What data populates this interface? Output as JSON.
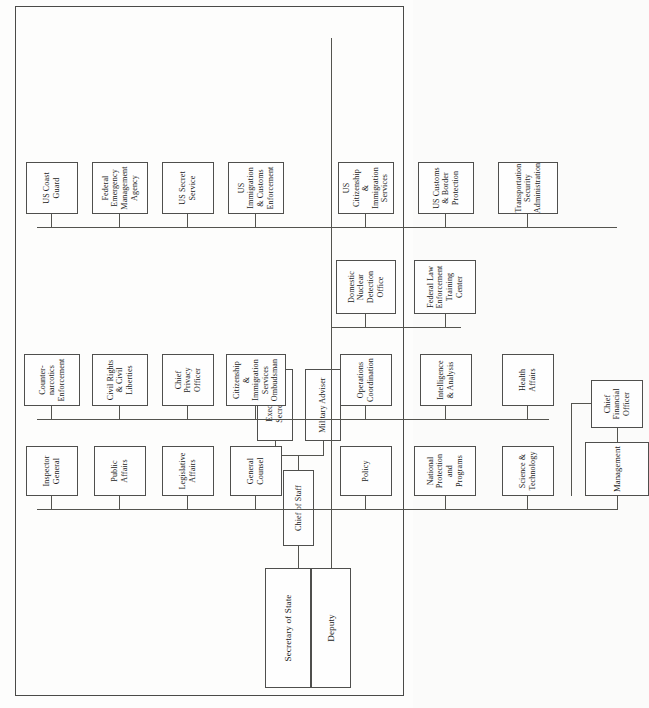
{
  "chart": {
    "type": "org-chart",
    "orientation": "rotated-90-ccw",
    "root": {
      "label": "Secretary of State",
      "deputy_label": "Deputy"
    },
    "staff": {
      "chief_of_staff": "Chief of Staff",
      "executive_secretariat": "Executive Secretariat",
      "military_adviser": "Military Adviser"
    },
    "column_a": [
      {
        "label": "Inspector General"
      },
      {
        "label": "Public Affairs"
      },
      {
        "label": "Legislative Affairs"
      },
      {
        "label": "General Counsel"
      },
      {
        "label": "Policy"
      },
      {
        "label": "National Protection and Programs"
      },
      {
        "label": "Science & Technology"
      },
      {
        "label": "Management",
        "attached": "Chief Financial Officer"
      }
    ],
    "column_b": [
      {
        "label": "Counter-narcotics Enforcement"
      },
      {
        "label": "Civil Rights & Civil Liberties"
      },
      {
        "label": "Chief Privacy Officer"
      },
      {
        "label": "Citizenship & Immigration Services Ombudsman"
      },
      {
        "label": "Operations Coordination"
      },
      {
        "label": "Intelligence & Analysis"
      },
      {
        "label": "Health Affairs"
      }
    ],
    "column_c": [
      {
        "label": "Domestic Nuclear Detection Office"
      },
      {
        "label": "Federal Law Enforcement Training Center"
      }
    ],
    "column_d": [
      {
        "label": "US Coast Guard"
      },
      {
        "label": "Federal Emergency Management Agency"
      },
      {
        "label": "US Secret Service"
      },
      {
        "label": "US Immigration & Customs Enforcement"
      },
      {
        "label": "US Citizenship & Immigration Services"
      },
      {
        "label": "US Customs & Border Protection"
      },
      {
        "label": "Transportation Security Administration"
      }
    ],
    "colors": {
      "box_border": "#4f4f4d",
      "box_fill": "#fefefe",
      "connector": "#54544f",
      "page_border": "#4a4a48",
      "page_background": "#fdfdfc",
      "text": "#1a1a1a"
    }
  }
}
